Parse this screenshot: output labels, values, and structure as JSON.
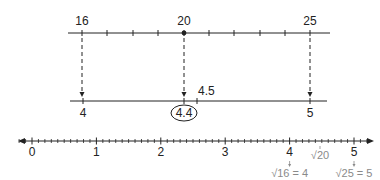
{
  "top_line": {
    "x_start": 68,
    "x_end": 330,
    "y": 33,
    "ticks": [
      {
        "value": 16,
        "x": 82,
        "label": "16"
      },
      {
        "value": 17,
        "x": 107,
        "label": ""
      },
      {
        "value": 18,
        "x": 133,
        "label": ""
      },
      {
        "value": 19,
        "x": 158,
        "label": ""
      },
      {
        "value": 20,
        "x": 184,
        "label": "20",
        "dot": true
      },
      {
        "value": 21,
        "x": 209,
        "label": ""
      },
      {
        "value": 22,
        "x": 234,
        "label": ""
      },
      {
        "value": 23,
        "x": 260,
        "label": ""
      },
      {
        "value": 24,
        "x": 285,
        "label": ""
      },
      {
        "value": 25,
        "x": 310,
        "label": "25"
      }
    ]
  },
  "middle_line": {
    "x_start": 70,
    "x_end": 327,
    "y": 101,
    "ticks": [
      {
        "value": 4,
        "x": 83,
        "label": "4",
        "label_pos": "below"
      },
      {
        "value": 4.4,
        "x": 184,
        "label": "4.4",
        "label_pos": "below",
        "circled": true
      },
      {
        "value": 4.5,
        "x": 197,
        "label": "4.5",
        "label_pos": "above-right"
      },
      {
        "value": 5,
        "x": 310,
        "label": "5",
        "label_pos": "below"
      }
    ]
  },
  "mapping_arrows": [
    {
      "from": "16",
      "to": "4",
      "x": 82
    },
    {
      "from": "20",
      "to": "4.4",
      "x": 184
    },
    {
      "from": "25",
      "to": "5",
      "x": 310
    }
  ],
  "bottom_line": {
    "x_start": 18,
    "x_end": 374,
    "y": 141,
    "origin_x": 32,
    "unit_px": 64.4,
    "minor_step": 0.1,
    "min": -0.2,
    "max": 5.25,
    "major_labels": [
      "0",
      "1",
      "2",
      "3",
      "4",
      "5"
    ],
    "annotations": [
      {
        "value": 4,
        "text": "√16 = 4",
        "color": "#8a8a8a"
      },
      {
        "value": 4.472,
        "text": "√20",
        "color": "#8a8a8a",
        "position": "above-label-row"
      },
      {
        "value": 5,
        "text": "√25 = 5",
        "color": "#8a8a8a"
      }
    ]
  },
  "colors": {
    "line": "#222222",
    "annotation": "#8a8a8a"
  }
}
